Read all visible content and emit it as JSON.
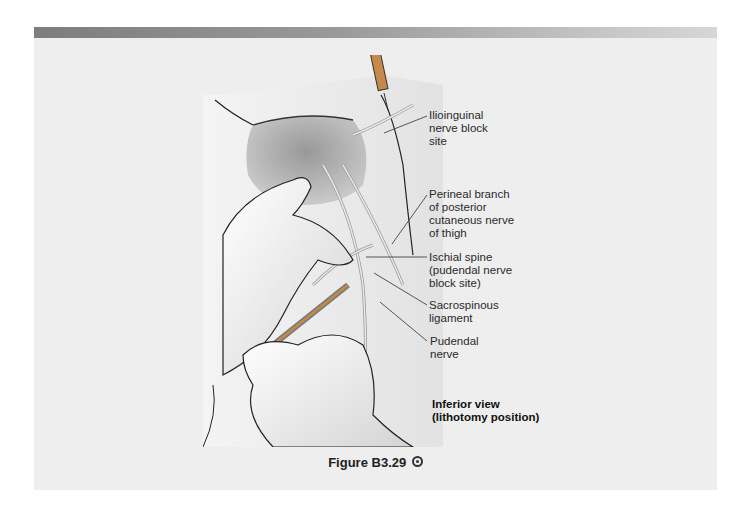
{
  "figure": {
    "caption": "Figure B3.29",
    "caption_icon": "circle-link-icon",
    "view_label": "Inferior view\n(lithotomy position)",
    "labels": [
      {
        "id": "ilioinguinal",
        "text": "Ilioinguinal\nnerve block\nsite"
      },
      {
        "id": "perineal-branch",
        "text": "Perineal branch\nof posterior\ncutaneous nerve\nof thigh"
      },
      {
        "id": "ischial-spine",
        "text": "Ischial spine\n(pudendal nerve\nblock site)"
      },
      {
        "id": "sacrospinous",
        "text": "Sacrospinous\nligament"
      },
      {
        "id": "pudendal-nerve",
        "text": "Pudendal\nnerve"
      }
    ],
    "illustration": "Pudendal and ilioinguinal nerve block, gloved hands guiding needle"
  },
  "colors": {
    "panel_bg": "#eeeeee",
    "header_bar_start": "#7d7d7d",
    "header_bar_end": "#d6d6d6",
    "syringe_fill": "#c7894a"
  }
}
